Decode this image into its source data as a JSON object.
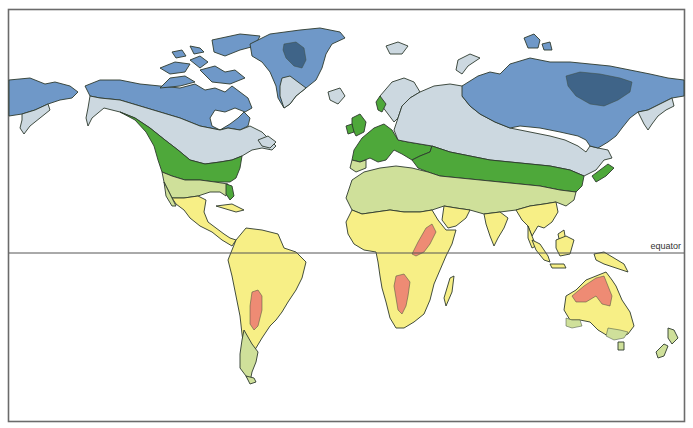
{
  "map": {
    "type": "world climate zones map",
    "labels": {
      "equator": "equator"
    },
    "zone_colors": {
      "ice_cap": "#3f6488",
      "polar_tundra": "#6f98c8",
      "subarctic": "#ccd8e0",
      "temperate": "#4ea83a",
      "steppe": "#cfe09a",
      "tropical": "#f7ef86",
      "desert": "#ee8b74",
      "water": "#ffffff"
    }
  }
}
